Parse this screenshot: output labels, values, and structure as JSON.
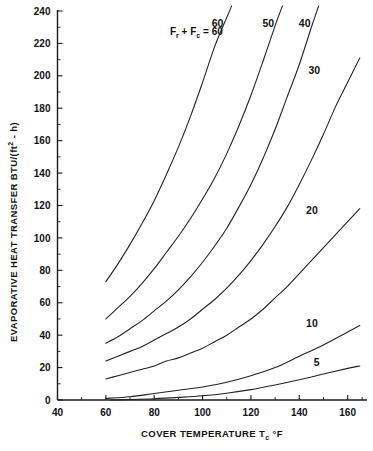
{
  "chart_data": {
    "type": "line",
    "title": "",
    "xlabel": "COVER TEMPERATURE  Tᴄ °F",
    "ylabel": "EVAPORATIVE HEAT TRANSFER   BTU/(ft² - h)",
    "xlim": [
      40,
      168
    ],
    "ylim": [
      0,
      240
    ],
    "xticks": [
      40,
      60,
      80,
      100,
      120,
      140,
      160
    ],
    "yticks": [
      0,
      20,
      40,
      60,
      80,
      100,
      120,
      140,
      160,
      180,
      200,
      220,
      240
    ],
    "xtick_labels": [
      "40",
      "60",
      "80",
      "100",
      "120",
      "140",
      "160"
    ],
    "ytick_labels": [
      "0",
      "20",
      "40",
      "60",
      "80",
      "100",
      "120",
      "140",
      "160",
      "180",
      "200",
      "220",
      "240"
    ],
    "grid": false,
    "legend_position": "inline-curve-labels",
    "legend_prefix": "F",
    "legend_prefix_sub1": "r",
    "legend_plus": " + F",
    "legend_prefix_sub2": "c",
    "legend_equals": " =  60",
    "series": [
      {
        "name": "60",
        "label": "60",
        "label_x": 112,
        "label_y": 232,
        "x": [
          60,
          65,
          70,
          75,
          80,
          85,
          90,
          95,
          100,
          105,
          110,
          112
        ],
        "y": [
          73,
          84,
          96,
          109,
          123,
          139,
          156,
          175,
          196,
          218,
          236,
          243
        ]
      },
      {
        "name": "50",
        "label": "50",
        "label_x": 133,
        "label_y": 232,
        "x": [
          60,
          65,
          70,
          75,
          80,
          85,
          90,
          95,
          100,
          105,
          110,
          115,
          120,
          125,
          130,
          133
        ],
        "y": [
          50,
          57,
          64,
          72,
          81,
          91,
          101,
          112,
          124,
          137,
          152,
          169,
          188,
          209,
          231,
          243
        ]
      },
      {
        "name": "40",
        "label": "40",
        "label_x": 148,
        "label_y": 232,
        "x": [
          60,
          65,
          70,
          75,
          80,
          85,
          90,
          95,
          100,
          105,
          110,
          115,
          120,
          125,
          130,
          135,
          140,
          145,
          148
        ],
        "y": [
          35,
          39,
          44,
          49,
          55,
          61,
          68,
          76,
          85,
          95,
          106,
          119,
          133,
          149,
          167,
          187,
          207,
          230,
          243
        ]
      },
      {
        "name": "30",
        "label": "30",
        "label_x": 152,
        "label_y": 203,
        "x": [
          60,
          65,
          70,
          75,
          80,
          85,
          90,
          95,
          100,
          105,
          110,
          115,
          120,
          125,
          130,
          135,
          140,
          145,
          150,
          155,
          160,
          165
        ],
        "y": [
          24,
          27,
          30,
          33,
          37,
          41,
          45,
          50,
          56,
          62,
          69,
          77,
          86,
          96,
          107,
          119,
          133,
          148,
          164,
          181,
          196,
          211
        ]
      },
      {
        "name": "20",
        "label": "20",
        "label_x": 151,
        "label_y": 117,
        "x": [
          60,
          65,
          70,
          75,
          80,
          85,
          90,
          95,
          100,
          105,
          110,
          115,
          120,
          125,
          130,
          135,
          140,
          145,
          150,
          155,
          160,
          165
        ],
        "y": [
          13,
          15,
          17,
          19,
          21,
          24,
          26,
          29,
          32,
          36,
          40,
          45,
          50,
          56,
          63,
          70,
          78,
          86,
          94,
          102,
          110,
          118
        ]
      },
      {
        "name": "10",
        "label": "10",
        "label_x": 151,
        "label_y": 47,
        "x": [
          60,
          70,
          80,
          90,
          100,
          110,
          120,
          130,
          140,
          150,
          160,
          165
        ],
        "y": [
          1,
          2,
          4,
          6,
          8,
          11,
          15,
          20,
          27,
          34,
          42,
          46
        ]
      },
      {
        "name": "5",
        "label": "5",
        "label_x": 153,
        "label_y": 23,
        "x": [
          62,
          70,
          80,
          90,
          100,
          110,
          120,
          130,
          140,
          150,
          160,
          165
        ],
        "y": [
          0,
          0.3,
          0.8,
          1.6,
          2.6,
          4.2,
          6.4,
          9.3,
          12.5,
          16,
          19.5,
          21
        ]
      }
    ]
  }
}
